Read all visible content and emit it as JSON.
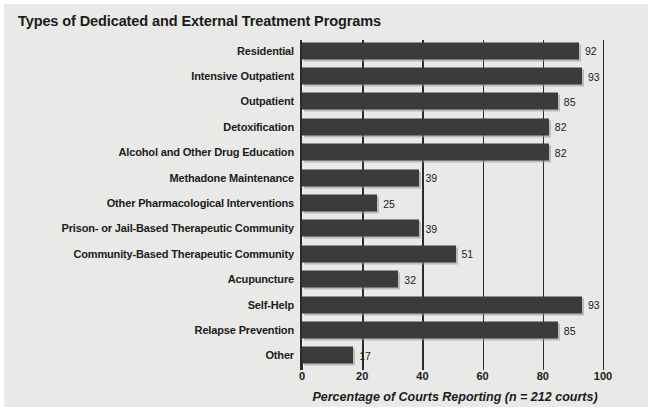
{
  "chart_data": {
    "type": "bar",
    "orientation": "horizontal",
    "title": "Types of Dedicated and External Treatment Programs",
    "xlabel": "Percentage of Courts Reporting (n = 212 courts)",
    "ylabel": "",
    "xlim": [
      0,
      100
    ],
    "xticks": [
      0,
      20,
      40,
      60,
      80,
      100
    ],
    "xtick_labels": [
      "0",
      "20",
      "40",
      "60",
      "80",
      "100"
    ],
    "grid": true,
    "grid_axis": "x",
    "legend": false,
    "bar_color": "#3b3b3b",
    "background_color": "#e9e9e7",
    "categories": [
      "Residential",
      "Intensive Outpatient",
      "Outpatient",
      "Detoxification",
      "Alcohol and Other Drug Education",
      "Methadone Maintenance",
      "Other Pharmacological Interventions",
      "Prison- or Jail-Based Therapeutic Community",
      "Community-Based Therapeutic Community",
      "Acupuncture",
      "Self-Help",
      "Relapse Prevention",
      "Other"
    ],
    "values": [
      92,
      93,
      85,
      82,
      82,
      39,
      25,
      39,
      51,
      32,
      93,
      85,
      17
    ],
    "value_labels": [
      "92",
      "93",
      "85",
      "82",
      "82",
      "39",
      "25",
      "39",
      "51",
      "32",
      "93",
      "85",
      "17"
    ]
  }
}
